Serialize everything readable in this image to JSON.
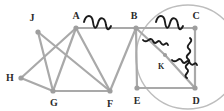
{
  "diagram": {
    "canvas": {
      "width": 224,
      "height": 111,
      "background": "#ffffff"
    },
    "style": {
      "edge_color": "#a9a9a9",
      "edge_width": 2.2,
      "node_color": "#9e9e9e",
      "node_radius": 2.6,
      "label_color": "#2b2b2b",
      "squiggle_color": "#1a1a1a",
      "circle_color": "#bdbdbd"
    },
    "vertices": [
      {
        "id": "J",
        "label": "J",
        "x": 38,
        "y": 32,
        "label_x": 32,
        "label_y": 18,
        "size": "normal"
      },
      {
        "id": "A",
        "label": "A",
        "x": 76,
        "y": 28,
        "label_x": 76,
        "label_y": 16,
        "size": "normal"
      },
      {
        "id": "B",
        "label": "B",
        "x": 136,
        "y": 28,
        "label_x": 134,
        "label_y": 16,
        "size": "normal"
      },
      {
        "id": "C",
        "label": "C",
        "x": 195,
        "y": 28,
        "label_x": 196,
        "label_y": 16,
        "size": "normal"
      },
      {
        "id": "H",
        "label": "H",
        "x": 21,
        "y": 78,
        "label_x": 10,
        "label_y": 78,
        "size": "normal"
      },
      {
        "id": "G",
        "label": "G",
        "x": 53,
        "y": 91,
        "label_x": 54,
        "label_y": 103,
        "size": "normal"
      },
      {
        "id": "F",
        "label": "F",
        "x": 110,
        "y": 91,
        "label_x": 110,
        "label_y": 104,
        "size": "normal"
      },
      {
        "id": "E",
        "label": "E",
        "x": 137,
        "y": 88,
        "label_x": 137,
        "label_y": 101,
        "size": "normal"
      },
      {
        "id": "D",
        "label": "D",
        "x": 195,
        "y": 88,
        "label_x": 196,
        "label_y": 101,
        "size": "normal"
      },
      {
        "id": "K",
        "label": "K",
        "x": 165,
        "y": 55,
        "label_x": 161,
        "label_y": 67,
        "size": "small"
      }
    ],
    "edges": [
      {
        "from": "A",
        "to": "B"
      },
      {
        "from": "B",
        "to": "C"
      },
      {
        "from": "C",
        "to": "D"
      },
      {
        "from": "D",
        "to": "E"
      },
      {
        "from": "E",
        "to": "B"
      },
      {
        "from": "B",
        "to": "F"
      },
      {
        "from": "B",
        "to": "K"
      },
      {
        "from": "K",
        "to": "D"
      },
      {
        "from": "A",
        "to": "G"
      },
      {
        "from": "A",
        "to": "F"
      },
      {
        "from": "A",
        "to": "H"
      },
      {
        "from": "J",
        "to": "G"
      },
      {
        "from": "J",
        "to": "F"
      },
      {
        "from": "H",
        "to": "G"
      },
      {
        "from": "G",
        "to": "F"
      }
    ],
    "circle": {
      "cx": 188,
      "cy": 57,
      "r": 52
    },
    "squiggles": [
      {
        "name": "squiggle-on-edge-ab",
        "on_edge": "A-B",
        "x": 84,
        "y": 22,
        "orientation": "horizontal"
      },
      {
        "name": "squiggle-on-edge-bc",
        "on_edge": "B-C",
        "x": 156,
        "y": 22,
        "orientation": "horizontal"
      },
      {
        "name": "squiggle-on-edge-cd",
        "on_edge": "C-D",
        "x": 190,
        "y": 38,
        "orientation": "vertical"
      },
      {
        "name": "squiggle-on-edge-bk",
        "on_edge": "B-K",
        "x": 143,
        "y": 40,
        "orientation": "diagonal"
      },
      {
        "name": "squiggle-on-edge-kd",
        "on_edge": "K-D",
        "x": 172,
        "y": 60,
        "orientation": "diagonal"
      }
    ]
  }
}
